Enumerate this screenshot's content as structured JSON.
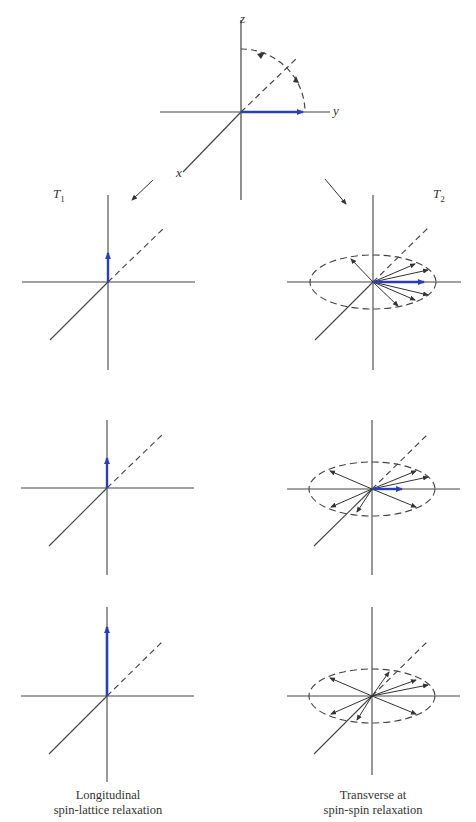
{
  "top_diagram": {
    "axis_labels": {
      "z": "z",
      "y": "y",
      "x": "x"
    },
    "description": "Net magnetization vector tipped into the transverse (y) plane; dashed arc indicates return toward z"
  },
  "left_column": {
    "title_main": "T",
    "title_sub": "1",
    "caption_line1": "Longitudinal",
    "caption_line2": "spin-lattice relaxation",
    "vector_lengths_px": [
      30,
      46,
      80
    ]
  },
  "right_column": {
    "title_main": "T",
    "title_sub": "2",
    "caption_line1": "Transverse at",
    "caption_line2": "spin-spin relaxation",
    "blue_vector_lengths_px": [
      52,
      36,
      0
    ]
  },
  "colors": {
    "axis": "#444444",
    "vector": "#2b3fb5",
    "spin": "#333333"
  }
}
